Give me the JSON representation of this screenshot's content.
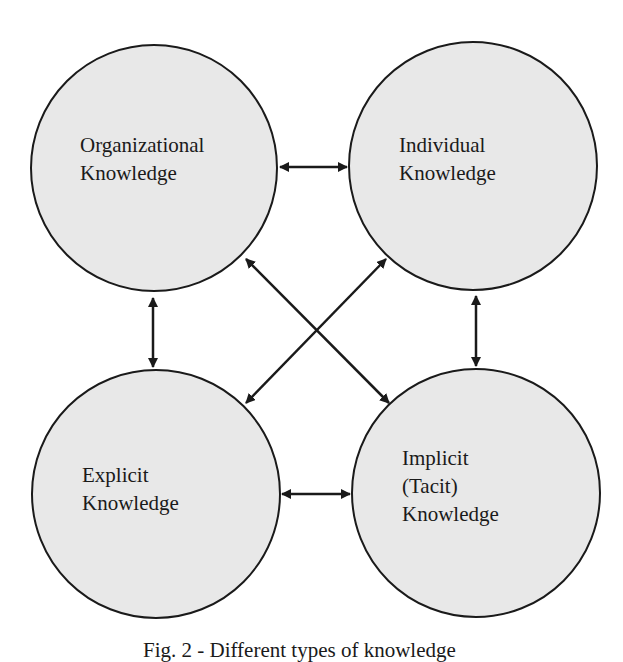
{
  "diagram": {
    "colors": {
      "background": "#ffffff",
      "circle_fill": "#e8e8e8",
      "stroke": "#1a1a1a",
      "text": "#1a1a1a"
    },
    "nodes": [
      {
        "id": "organizational",
        "lines": [
          "Organizational",
          "Knowledge"
        ]
      },
      {
        "id": "individual",
        "lines": [
          "Individual",
          "Knowledge"
        ]
      },
      {
        "id": "explicit",
        "lines": [
          "Explicit",
          "Knowledge"
        ]
      },
      {
        "id": "implicit",
        "lines": [
          "Implicit",
          "(Tacit)",
          "Knowledge"
        ]
      }
    ],
    "edges": [
      {
        "from": "organizational",
        "to": "individual",
        "type": "bidirectional"
      },
      {
        "from": "organizational",
        "to": "explicit",
        "type": "bidirectional"
      },
      {
        "from": "individual",
        "to": "implicit",
        "type": "bidirectional"
      },
      {
        "from": "explicit",
        "to": "implicit",
        "type": "bidirectional"
      },
      {
        "from": "organizational",
        "to": "implicit",
        "type": "bidirectional"
      },
      {
        "from": "individual",
        "to": "explicit",
        "type": "bidirectional"
      }
    ],
    "caption": "Fig. 2 - Different types of knowledge"
  }
}
